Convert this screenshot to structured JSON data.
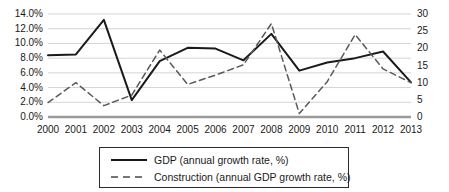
{
  "chart_data": {
    "type": "line",
    "title": "",
    "xlabel": "",
    "ylabel": "",
    "grid": true,
    "legend_position": "bottom",
    "categories": [
      "2000",
      "2001",
      "2002",
      "2003",
      "2004",
      "2005",
      "2006",
      "2007",
      "2008",
      "2009",
      "2010",
      "2011",
      "2012",
      "2013"
    ],
    "axes": {
      "left": {
        "label": "",
        "ylim": [
          0,
          14
        ],
        "tick_step": 2,
        "tick_labels": [
          "0.0%",
          "2.0%",
          "4.0%",
          "6.0%",
          "8.0%",
          "10.0%",
          "12.0%",
          "14.0%"
        ],
        "tick_values": [
          0,
          2,
          4,
          6,
          8,
          10,
          12,
          14
        ]
      },
      "right": {
        "label": "",
        "ylim": [
          0,
          30
        ],
        "tick_step": 5,
        "tick_labels": [
          "0",
          "5",
          "10",
          "15",
          "20",
          "25",
          "30"
        ],
        "tick_values": [
          0,
          5,
          10,
          15,
          20,
          25,
          30
        ]
      }
    },
    "series": [
      {
        "name": "GDP (annual growth rate, %)",
        "axis": "left",
        "style": "solid",
        "color": "#1a1a1a",
        "values": [
          8.4,
          8.5,
          13.2,
          2.3,
          7.6,
          9.4,
          9.3,
          7.7,
          11.3,
          6.3,
          7.4,
          8.0,
          8.9,
          4.7
        ]
      },
      {
        "name": "Construction (annual GDP growth rate, %)",
        "axis": "right",
        "style": "dashed",
        "color": "#6e6e6e",
        "values": [
          4.2,
          10.0,
          3.3,
          6.4,
          19.5,
          9.5,
          12.2,
          15.2,
          27.2,
          1.0,
          10.3,
          24.0,
          14.0,
          10.0
        ]
      }
    ]
  },
  "legend": {
    "items": [
      {
        "label": "GDP (annual growth rate, %)",
        "style": "solid"
      },
      {
        "label": "Construction (annual GDP growth rate, %)",
        "style": "dashed"
      }
    ]
  },
  "colors": {
    "gdp_line": "#1a1a1a",
    "construction_line": "#6e6e6e",
    "gridline": "#d4d4d4",
    "baseline": "#9a9a9a",
    "text": "#1a1a1a",
    "legend_border": "#2b2b2b"
  }
}
